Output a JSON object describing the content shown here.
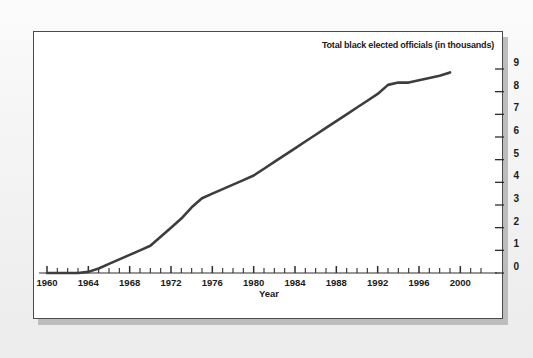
{
  "figure": {
    "background_color": "#f2f2f2",
    "frame_color": "#4a4a4a",
    "shadow_color": "#bdbdbd",
    "plot_background": "#ffffff"
  },
  "chart_data": {
    "type": "line",
    "title": "Total black elected officials (in thousands)",
    "title_position": "top-right",
    "xlabel": "Year",
    "ylabel": "",
    "xlim": [
      1960,
      2002
    ],
    "ylim": [
      0,
      9
    ],
    "grid": false,
    "legend": null,
    "line_color": "#3d3d3d",
    "line_width": 2.6,
    "axis_side": {
      "y": "right",
      "x": "bottom"
    },
    "xticks": [
      1960,
      1964,
      1968,
      1972,
      1976,
      1980,
      1984,
      1988,
      1992,
      1996,
      2000
    ],
    "xtick_labels": [
      "1960",
      "1964",
      "1968",
      "1972",
      "1976",
      "1980",
      "1984",
      "1988",
      "1992",
      "1996",
      "2000"
    ],
    "xminor_tick_interval": 1,
    "yticks": [
      0,
      1,
      2,
      3,
      4,
      5,
      6,
      7,
      8,
      9
    ],
    "ytick_labels": [
      "0",
      "1",
      "2",
      "3",
      "4",
      "5",
      "6",
      "7",
      "8",
      "9"
    ],
    "x": [
      1960,
      1961,
      1962,
      1963,
      1964,
      1965,
      1966,
      1967,
      1968,
      1969,
      1970,
      1971,
      1972,
      1973,
      1974,
      1975,
      1976,
      1977,
      1978,
      1979,
      1980,
      1981,
      1982,
      1983,
      1984,
      1985,
      1986,
      1987,
      1988,
      1989,
      1990,
      1991,
      1992,
      1993,
      1994,
      1995,
      1996,
      1997,
      1998,
      1999
    ],
    "values": [
      0.0,
      0.0,
      0.0,
      0.0,
      0.05,
      0.2,
      0.4,
      0.6,
      0.8,
      1.0,
      1.2,
      1.6,
      2.0,
      2.4,
      2.9,
      3.3,
      3.5,
      3.7,
      3.9,
      4.1,
      4.3,
      4.6,
      4.9,
      5.2,
      5.5,
      5.8,
      6.1,
      6.4,
      6.7,
      7.0,
      7.3,
      7.6,
      7.9,
      8.3,
      8.4,
      8.4,
      8.5,
      8.6,
      8.7,
      8.85
    ],
    "series_name": "Total black elected officials (in thousands)",
    "annotations": [
      "Flat near zero from 1960 through 1964",
      "Steep rise 1965 through 1975",
      "Steady near-linear rise 1976 through 1993",
      "Plateau around 8.4 from 1993 to 1995",
      "Ends near 8.9 in 1999"
    ]
  }
}
